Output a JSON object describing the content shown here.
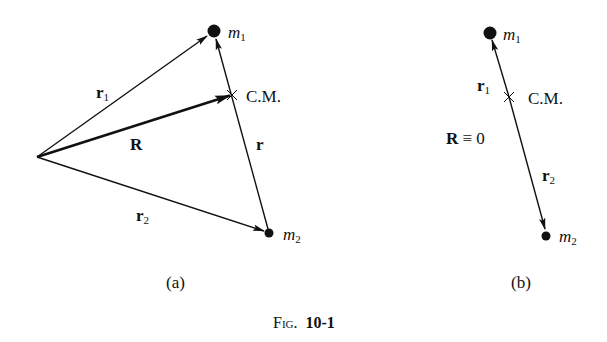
{
  "figure": {
    "caption_prefix": "Fig.",
    "caption_number": "10-1"
  },
  "panel_a": {
    "label": "(a)",
    "points": {
      "origin": [
        37,
        157
      ],
      "m1": [
        214,
        31
      ],
      "cm": [
        232,
        95
      ],
      "m2": [
        269,
        233
      ]
    },
    "vectors": [
      {
        "name": "r1",
        "from": "origin",
        "to": "m1",
        "bold_stem": "r",
        "sub": "1"
      },
      {
        "name": "R",
        "from": "origin",
        "to": "cm",
        "bold_stem": "R",
        "sub": "",
        "thick": true
      },
      {
        "name": "r2",
        "from": "origin",
        "to": "m2",
        "bold_stem": "r",
        "sub": "2"
      },
      {
        "name": "r",
        "from": "m2",
        "to": "m1",
        "bold_stem": "r",
        "sub": ""
      }
    ],
    "labels": {
      "m1_stem": "m",
      "m1_sub": "1",
      "m2_stem": "m",
      "m2_sub": "2",
      "cm": "C.M.",
      "r1_stem": "r",
      "r1_sub": "1",
      "R": "R",
      "r2_stem": "r",
      "r2_sub": "2",
      "r": "r"
    }
  },
  "panel_b": {
    "label": "(b)",
    "points": {
      "m1": [
        490,
        33
      ],
      "cm": [
        509,
        97
      ],
      "m2": [
        546,
        236
      ]
    },
    "vectors": [
      {
        "name": "r1",
        "from": "cm",
        "to": "m1",
        "bold_stem": "r",
        "sub": "1"
      },
      {
        "name": "r2",
        "from": "cm",
        "to": "m2",
        "bold_stem": "r",
        "sub": "2"
      }
    ],
    "labels": {
      "m1_stem": "m",
      "m1_sub": "1",
      "m2_stem": "m",
      "m2_sub": "2",
      "cm": "C.M.",
      "r1_stem": "r",
      "r1_sub": "1",
      "r2_stem": "r",
      "r2_sub": "2",
      "R_stem": "R",
      "R_equiv": "≡ 0"
    }
  }
}
